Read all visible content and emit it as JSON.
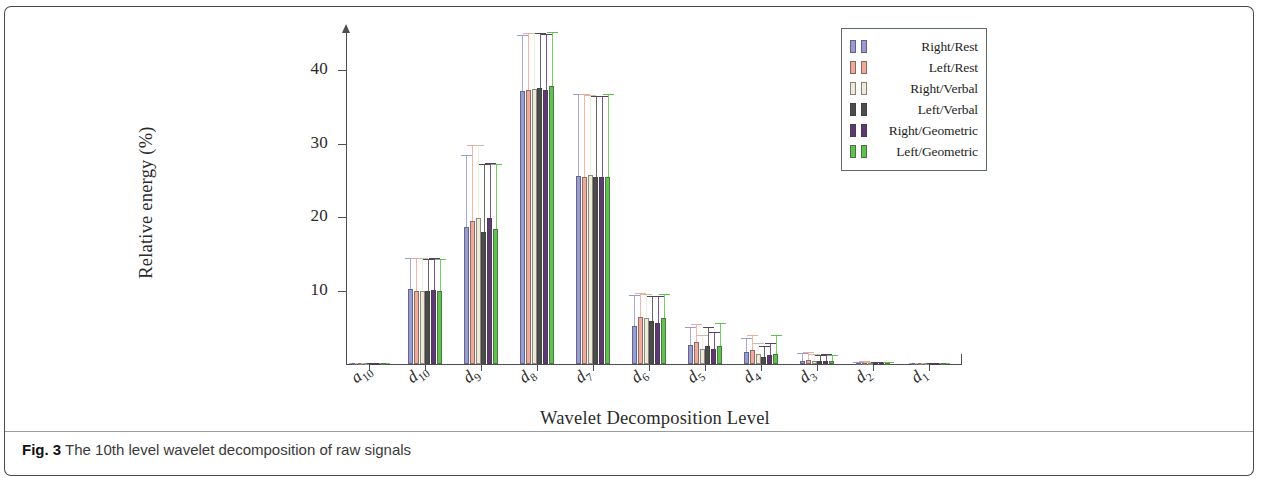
{
  "figure": {
    "caption_label": "Fig. 3",
    "caption_text": "The 10th level wavelet decomposition of raw signals"
  },
  "chart_data": {
    "type": "bar",
    "title": "",
    "xlabel": "Wavelet Decomposition Level",
    "ylabel": "Relative energy (%)",
    "ylim": [
      0,
      45
    ],
    "yticks": [
      10,
      20,
      30,
      40
    ],
    "grid": false,
    "legend_position": "top-right",
    "error_bars": "standard deviation",
    "categories": [
      "a10",
      "d10",
      "d9",
      "d8",
      "d7",
      "d6",
      "d5",
      "d4",
      "d3",
      "d2",
      "d1"
    ],
    "category_labels": [
      {
        "base": "a",
        "sub": "10"
      },
      {
        "base": "d",
        "sub": "10"
      },
      {
        "base": "d",
        "sub": "9"
      },
      {
        "base": "d",
        "sub": "8"
      },
      {
        "base": "d",
        "sub": "7"
      },
      {
        "base": "d",
        "sub": "6"
      },
      {
        "base": "d",
        "sub": "5"
      },
      {
        "base": "d",
        "sub": "4"
      },
      {
        "base": "d",
        "sub": "3"
      },
      {
        "base": "d",
        "sub": "2"
      },
      {
        "base": "d",
        "sub": "1"
      }
    ],
    "series": [
      {
        "name": "Right/Rest",
        "color": "#9a9ad6",
        "values": [
          0.05,
          10.2,
          18.6,
          37.2,
          25.6,
          5.2,
          2.6,
          1.6,
          0.45,
          0.12,
          0.05
        ],
        "errors": [
          0.05,
          4.2,
          9.8,
          7.6,
          11.2,
          4.2,
          2.4,
          1.9,
          1.05,
          0.22,
          0.07
        ]
      },
      {
        "name": "Left/Rest",
        "color": "#f0a99a",
        "values": [
          0.05,
          10.0,
          19.4,
          37.3,
          25.4,
          6.4,
          3.0,
          1.9,
          0.5,
          0.14,
          0.05
        ],
        "errors": [
          0.05,
          4.4,
          10.4,
          7.7,
          11.4,
          3.2,
          2.5,
          2.1,
          1.1,
          0.24,
          0.07
        ]
      },
      {
        "name": "Right/Verbal",
        "color": "#efe9d8",
        "values": [
          0.05,
          9.9,
          19.9,
          37.4,
          25.7,
          6.2,
          2.1,
          1.3,
          0.4,
          0.11,
          0.04
        ],
        "errors": [
          0.05,
          4.5,
          9.9,
          7.6,
          10.9,
          3.3,
          1.9,
          1.6,
          0.95,
          0.2,
          0.06
        ]
      },
      {
        "name": "Left/Verbal",
        "color": "#4c4c4c",
        "values": [
          0.05,
          10.0,
          18.0,
          37.5,
          25.5,
          5.8,
          2.4,
          1.0,
          0.35,
          0.1,
          0.04
        ],
        "errors": [
          0.05,
          4.3,
          9.2,
          7.5,
          11.0,
          3.5,
          2.6,
          1.5,
          0.9,
          0.18,
          0.06
        ]
      },
      {
        "name": "Right/Geometric",
        "color": "#5e3a73",
        "values": [
          0.05,
          10.1,
          19.8,
          37.3,
          25.4,
          5.6,
          2.0,
          1.2,
          0.38,
          0.1,
          0.04
        ],
        "errors": [
          0.05,
          4.3,
          7.6,
          7.6,
          11.1,
          3.6,
          2.3,
          1.7,
          0.92,
          0.19,
          0.06
        ]
      },
      {
        "name": "Left/Geometric",
        "color": "#5fc14e",
        "values": [
          0.05,
          10.0,
          18.4,
          37.8,
          25.5,
          6.3,
          2.5,
          1.4,
          0.36,
          0.1,
          0.04
        ],
        "errors": [
          0.05,
          4.3,
          8.8,
          7.4,
          11.2,
          3.2,
          3.1,
          2.5,
          0.88,
          0.18,
          0.06
        ]
      }
    ]
  }
}
